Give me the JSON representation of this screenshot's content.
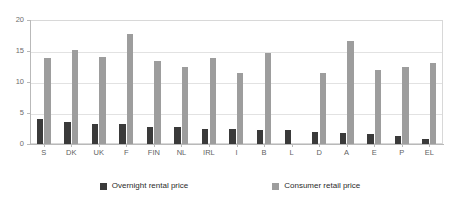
{
  "chart_data": {
    "type": "bar",
    "title": "",
    "subtitle": "",
    "xlabel": "",
    "ylabel": "",
    "ylim": [
      0,
      20
    ],
    "yticks": [
      0,
      5,
      10,
      15,
      20
    ],
    "ytick_labels": [
      "0",
      "5",
      "10",
      "15",
      "20"
    ],
    "grid": true,
    "legend_position": "bottom",
    "categories": [
      "S",
      "DK",
      "UK",
      "F",
      "FIN",
      "NL",
      "IRL",
      "I",
      "B",
      "L",
      "D",
      "A",
      "E",
      "P",
      "EL"
    ],
    "series": [
      {
        "name": "Overnight rental price",
        "color": "#3a3a3a",
        "values": [
          4.0,
          3.5,
          3.2,
          3.2,
          2.8,
          2.7,
          2.5,
          2.4,
          2.3,
          2.3,
          1.9,
          1.8,
          1.6,
          1.3,
          0.8
        ]
      },
      {
        "name": "Consumer retail price",
        "color": "#9d9d9d",
        "values": [
          13.8,
          15.1,
          14.1,
          17.8,
          13.4,
          12.4,
          13.9,
          11.5,
          14.7,
          null,
          11.4,
          16.6,
          11.9,
          12.4,
          13.0
        ]
      }
    ]
  },
  "legend": {
    "entries": [
      {
        "label": "Overnight rental price",
        "swatch": "#3a3a3a",
        "icon": "square-swatch-dark"
      },
      {
        "label": "Consumer retail price",
        "swatch": "#9d9d9d",
        "icon": "square-swatch-grey"
      }
    ]
  }
}
